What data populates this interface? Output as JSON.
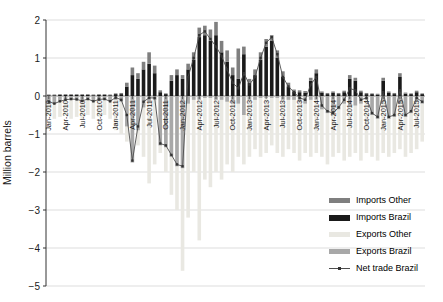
{
  "chart_data": {
    "type": "bar",
    "subtype": "stacked-bars-with-line-overlay",
    "title": "",
    "xlabel": "",
    "ylabel": "Million barrels",
    "ylim": [
      -5,
      2
    ],
    "yticks": [
      -5,
      -4,
      -3,
      -2,
      -1,
      0,
      1,
      2
    ],
    "grid": "horizontal",
    "legend_position": "bottom-right",
    "x_tick_interval_months": 3,
    "x_tick_labels": [
      "Jan-2010",
      "Apr-2010",
      "Jul-2010",
      "Oct-2010",
      "Jan-2011",
      "Apr-2011",
      "Jul-2011",
      "Oct-2011",
      "Jan-2012",
      "Apr-2012",
      "Jul-2012",
      "Oct-2012",
      "Jan-2013",
      "Apr-2013",
      "Jul-2013",
      "Oct-2013",
      "Jan-2014",
      "Apr-2014",
      "Jul-2014",
      "Oct-2014",
      "Jan-2015",
      "Apr-2015",
      "Jul-2015"
    ],
    "categories": [
      "Jan-2010",
      "Feb-2010",
      "Mar-2010",
      "Apr-2010",
      "May-2010",
      "Jun-2010",
      "Jul-2010",
      "Aug-2010",
      "Sep-2010",
      "Oct-2010",
      "Nov-2010",
      "Dec-2010",
      "Jan-2011",
      "Feb-2011",
      "Mar-2011",
      "Apr-2011",
      "May-2011",
      "Jun-2011",
      "Jul-2011",
      "Aug-2011",
      "Sep-2011",
      "Oct-2011",
      "Nov-2011",
      "Dec-2011",
      "Jan-2012",
      "Feb-2012",
      "Mar-2012",
      "Apr-2012",
      "May-2012",
      "Jun-2012",
      "Jul-2012",
      "Aug-2012",
      "Sep-2012",
      "Oct-2012",
      "Nov-2012",
      "Dec-2012",
      "Jan-2013",
      "Feb-2013",
      "Mar-2013",
      "Apr-2013",
      "May-2013",
      "Jun-2013",
      "Jul-2013",
      "Aug-2013",
      "Sep-2013",
      "Oct-2013",
      "Nov-2013",
      "Dec-2013",
      "Jan-2014",
      "Feb-2014",
      "Mar-2014",
      "Apr-2014",
      "May-2014",
      "Jun-2014",
      "Jul-2014",
      "Aug-2014",
      "Sep-2014",
      "Oct-2014",
      "Nov-2014",
      "Dec-2014",
      "Jan-2015",
      "Feb-2015",
      "Mar-2015",
      "Apr-2015",
      "May-2015",
      "Jun-2015",
      "Jul-2015",
      "Aug-2015"
    ],
    "series": [
      {
        "name": "Imports Other",
        "type": "bar",
        "stack": "imports",
        "color": "#7f7f7f",
        "values": [
          0.02,
          0.02,
          0.02,
          0.02,
          0.02,
          0.02,
          0.02,
          0.02,
          0.02,
          0.02,
          0.02,
          0.02,
          0.02,
          0.03,
          0.1,
          0.2,
          0.15,
          0.2,
          0.3,
          0.2,
          0.05,
          0.02,
          0.15,
          0.15,
          0.1,
          0.15,
          0.2,
          0.25,
          0.25,
          0.3,
          0.35,
          0.3,
          0.3,
          0.2,
          0.8,
          0.2,
          0.1,
          0.15,
          0.2,
          0.2,
          0.15,
          0.2,
          0.15,
          0.1,
          0.05,
          0.05,
          0.05,
          0.08,
          0.1,
          0.04,
          0.03,
          0.04,
          0.03,
          0.04,
          0.1,
          0.08,
          0.04,
          0.03,
          0.02,
          0.02,
          0.08,
          0.04,
          0.03,
          0.1,
          0.03,
          0.02,
          0.04,
          0.02
        ]
      },
      {
        "name": "Imports Brazil",
        "type": "bar",
        "stack": "imports",
        "color": "#1a1a1a",
        "values": [
          0.02,
          0.02,
          0.03,
          0.03,
          0.03,
          0.03,
          0.03,
          0.03,
          0.02,
          0.03,
          0.03,
          0.02,
          0.05,
          0.05,
          0.25,
          0.55,
          0.45,
          0.7,
          0.85,
          0.6,
          0.1,
          0.05,
          0.4,
          0.55,
          0.45,
          0.7,
          0.95,
          1.55,
          1.6,
          1.45,
          1.6,
          1.15,
          0.9,
          0.55,
          0.45,
          1.1,
          0.35,
          0.55,
          0.95,
          1.3,
          1.45,
          1.0,
          0.5,
          0.25,
          0.12,
          0.1,
          0.08,
          0.4,
          0.6,
          0.08,
          0.05,
          0.08,
          0.05,
          0.1,
          0.45,
          0.4,
          0.1,
          0.05,
          0.05,
          0.04,
          0.4,
          0.08,
          0.05,
          0.5,
          0.06,
          0.05,
          0.1,
          0.05
        ]
      },
      {
        "name": "Exports Other",
        "type": "bar",
        "stack": "exports",
        "color": "#e9e8e2",
        "values": [
          -0.5,
          -0.6,
          -0.55,
          -0.5,
          -0.6,
          -0.55,
          -0.6,
          -0.5,
          -0.6,
          -0.55,
          -0.5,
          -0.6,
          -0.9,
          -1.0,
          -1.2,
          -1.5,
          -1.3,
          -1.6,
          -2.3,
          -1.8,
          -1.5,
          -2.0,
          -2.6,
          -3.0,
          -4.6,
          -3.2,
          -2.0,
          -3.8,
          -2.2,
          -2.4,
          -2.0,
          -2.2,
          -1.8,
          -2.0,
          -1.6,
          -1.8,
          -1.6,
          -1.4,
          -1.6,
          -1.5,
          -1.3,
          -1.5,
          -1.6,
          -1.4,
          -1.5,
          -1.7,
          -1.5,
          -1.6,
          -1.5,
          -1.6,
          -1.8,
          -1.6,
          -1.5,
          -1.7,
          -1.6,
          -1.5,
          -1.7,
          -1.5,
          -1.6,
          -1.7,
          -1.5,
          -1.6,
          -1.5,
          -1.4,
          -1.6,
          -1.5,
          -1.4,
          -1.2
        ]
      },
      {
        "name": "Exports Brazil",
        "type": "bar",
        "stack": "exports",
        "color": "#a8a8a8",
        "values": [
          -0.15,
          -0.2,
          -0.15,
          -0.1,
          -0.1,
          -0.1,
          -0.15,
          -0.1,
          -0.15,
          -0.1,
          -0.1,
          -0.15,
          -0.1,
          -0.15,
          -0.8,
          -1.75,
          -0.9,
          -0.3,
          -0.15,
          -0.1,
          -1.3,
          -1.35,
          -1.6,
          -1.85,
          -1.9,
          -0.2,
          -0.1,
          -0.1,
          -0.05,
          -0.05,
          -0.1,
          -0.1,
          -0.15,
          -0.2,
          -0.2,
          -0.5,
          -0.1,
          -0.1,
          -0.05,
          -0.05,
          -0.05,
          -0.05,
          -0.1,
          -0.1,
          -0.1,
          -0.15,
          -0.2,
          -0.1,
          -0.1,
          -0.35,
          -0.45,
          -0.5,
          -0.35,
          -0.2,
          -0.25,
          -0.25,
          -0.2,
          -0.1,
          -0.5,
          -0.6,
          -0.15,
          -0.6,
          -0.55,
          -0.2,
          -0.55,
          -0.45,
          -0.15,
          -0.2
        ]
      },
      {
        "name": "Net trade Brazil",
        "type": "line",
        "color": "#4d4d4d",
        "marker": "square",
        "values": [
          -0.15,
          -0.2,
          -0.14,
          -0.1,
          -0.08,
          -0.09,
          -0.13,
          -0.08,
          -0.14,
          -0.09,
          -0.08,
          -0.14,
          -0.04,
          -0.1,
          -0.5,
          -1.7,
          -0.8,
          -0.15,
          -0.05,
          -0.05,
          -1.25,
          -1.3,
          -1.55,
          -1.8,
          -1.85,
          0.5,
          1.0,
          1.6,
          1.7,
          1.5,
          1.3,
          1.05,
          0.7,
          0.35,
          0.2,
          0.6,
          0.3,
          0.5,
          1.0,
          1.4,
          1.55,
          1.1,
          0.5,
          0.25,
          0.1,
          -0.05,
          -0.1,
          0.3,
          0.5,
          -0.25,
          -0.4,
          -0.45,
          -0.3,
          -0.1,
          0.2,
          0.15,
          -0.1,
          -0.05,
          -0.45,
          -0.55,
          0.1,
          -0.55,
          -0.5,
          0.15,
          -0.5,
          -0.4,
          -0.05,
          -0.15
        ]
      }
    ],
    "colors": {
      "gridline": "#d4d4d4",
      "zero_line": "#8c8c8c",
      "axis": "#333333",
      "tick_text": "#1a1a1a"
    }
  }
}
